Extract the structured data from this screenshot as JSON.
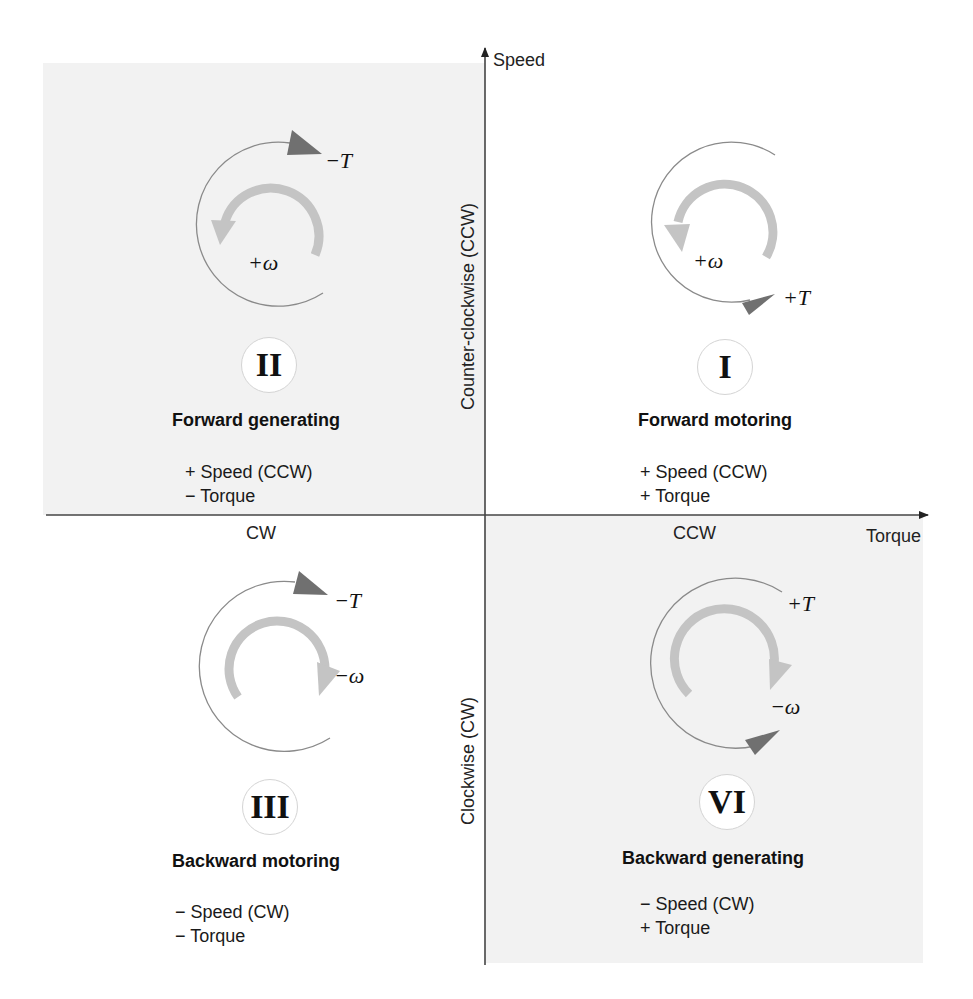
{
  "axes": {
    "y_label": "Speed",
    "x_label": "Torque",
    "x_negative_label": "CW",
    "x_positive_label": "CCW",
    "y_positive_side_label": "Counter-clockwise (CCW)",
    "y_negative_side_label": "Clockwise (CW)"
  },
  "quadrants": [
    {
      "id": "II",
      "numeral": "II",
      "title": "Forward generating",
      "line1": "+ Speed (CCW)",
      "line2": "− Torque",
      "torque_symbol": "−T",
      "speed_symbol": "+ω",
      "shaded": true
    },
    {
      "id": "I",
      "numeral": "I",
      "title": "Forward motoring",
      "line1": "+ Speed (CCW)",
      "line2": "+ Torque",
      "torque_symbol": "+T",
      "speed_symbol": "+ω",
      "shaded": false
    },
    {
      "id": "III",
      "numeral": "III",
      "title": "Backward motoring",
      "line1": "− Speed (CW)",
      "line2": "− Torque",
      "torque_symbol": "−T",
      "speed_symbol": "−ω",
      "shaded": false
    },
    {
      "id": "VI",
      "numeral": "VI",
      "title": "Backward generating",
      "line1": "− Speed (CW)",
      "line2": "+ Torque",
      "torque_symbol": "+T",
      "speed_symbol": "−ω",
      "shaded": true
    }
  ],
  "colors": {
    "shade": "#f2f2f2",
    "axis": "#222222",
    "torque_arrow": "#707070",
    "speed_arrow": "#c4c4c4",
    "thin_circle": "#8a8a8a"
  }
}
